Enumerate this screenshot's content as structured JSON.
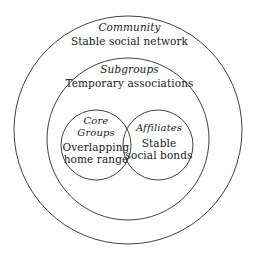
{
  "diagram": {
    "type": "nested-venn-social-structure",
    "background_color": "#ffffff",
    "stroke_color": "#2b2b2b",
    "rings": [
      {
        "id": "community",
        "title": "Community",
        "description": "Stable social network",
        "shape": "circle",
        "cx": 128,
        "cy": 130,
        "r": 114
      },
      {
        "id": "subgroups",
        "title": "Subgroups",
        "description": "Temporary associations",
        "shape": "circle",
        "cx": 128,
        "cy": 139,
        "r": 81
      }
    ],
    "venn": [
      {
        "id": "core-groups",
        "title_line1": "Core",
        "title_line2": "Groups",
        "description_line1": "Overlapping",
        "description_line2": "home range",
        "shape": "circle",
        "cx": 96,
        "cy": 145,
        "r": 35
      },
      {
        "id": "affiliates",
        "title_line1": "Affiliates",
        "description_line1": "Stable",
        "description_line2": "social bonds",
        "shape": "circle",
        "cx": 158,
        "cy": 145,
        "r": 35
      }
    ]
  }
}
